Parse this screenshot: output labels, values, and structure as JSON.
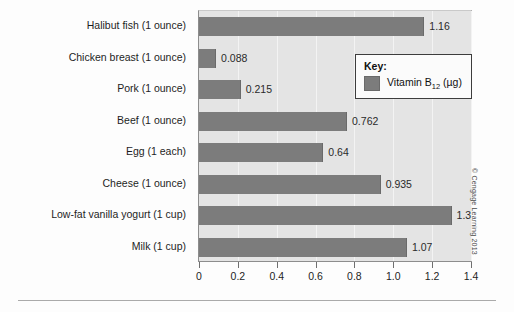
{
  "chart_data": {
    "type": "bar",
    "orientation": "horizontal",
    "title": "",
    "xlabel": "",
    "ylabel": "",
    "xlim": [
      0,
      1.4
    ],
    "grid": true,
    "legend_position": "inside-right-top",
    "categories": [
      "Halibut fish (1 ounce)",
      "Chicken breast (1 ounce)",
      "Pork (1 ounce)",
      "Beef (1 ounce)",
      "Egg (1 each)",
      "Cheese (1 ounce)",
      "Low-fat vanilla yogurt (1 cup)",
      "Milk (1 cup)"
    ],
    "values": [
      1.16,
      0.088,
      0.215,
      0.762,
      0.64,
      0.935,
      1.3,
      1.07
    ],
    "value_labels": [
      "1.16",
      "0.088",
      "0.215",
      "0.762",
      "0.64",
      "0.935",
      "1.3",
      "1.07"
    ],
    "series": [
      {
        "name": "Vitamin B12 (µg)",
        "values": [
          1.16,
          0.088,
          0.215,
          0.762,
          0.64,
          0.935,
          1.3,
          1.07
        ]
      }
    ],
    "xticks": [
      0,
      0.2,
      0.4,
      0.6,
      0.8,
      1.0,
      1.2,
      1.4
    ],
    "xtick_labels": [
      "0",
      "0.2",
      "0.4",
      "0.6",
      "0.8",
      "1.0",
      "1.2",
      "1.4"
    ],
    "colors": {
      "bar": "#7c7c7c",
      "plot_background": "#e4e4e4",
      "gridline": "#f3f3f3",
      "axis": "#6f6f6f",
      "text": "#1d1d1d"
    }
  },
  "legend": {
    "title": "Key:",
    "entry_label_prefix": "Vitamin B",
    "entry_label_sub": "12",
    "entry_label_suffix": " (µg)",
    "swatch_color": "#7c7c7c"
  },
  "credit": {
    "text": "© Cengage Learning 2013"
  }
}
